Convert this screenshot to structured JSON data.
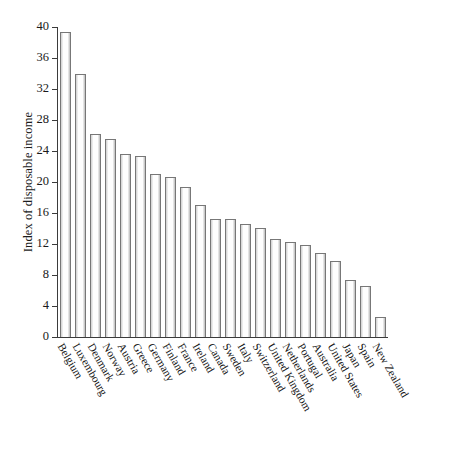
{
  "chart_data": {
    "type": "bar",
    "title": "",
    "subtitle": "",
    "xlabel": "",
    "ylabel": "Index of disposable income",
    "ylim": [
      0,
      40
    ],
    "yticks": [
      0,
      4,
      8,
      12,
      16,
      20,
      24,
      28,
      32,
      36,
      40
    ],
    "grid": false,
    "legend": null,
    "bar_face_color": "#ffffff",
    "bar_edge_color": "#777777",
    "axis_color": "#3b3b3b",
    "categories": [
      "Belgium",
      "Luxembourg",
      "Denmark",
      "Norway",
      "Austria",
      "Greece",
      "Germany",
      "Finland",
      "France",
      "Ireland",
      "Canada",
      "Sweden",
      "Italy",
      "Switzerland",
      "United Kingdom",
      "Netherlands",
      "Portugal",
      "Australia",
      "United States",
      "Japan",
      "Spain",
      "New Zealand"
    ],
    "values": [
      39.3,
      34.0,
      26.2,
      25.6,
      23.6,
      23.3,
      21.0,
      20.7,
      19.4,
      17.0,
      15.2,
      15.2,
      14.6,
      14.1,
      12.7,
      12.3,
      11.9,
      10.8,
      9.8,
      7.4,
      6.6,
      2.6
    ]
  }
}
